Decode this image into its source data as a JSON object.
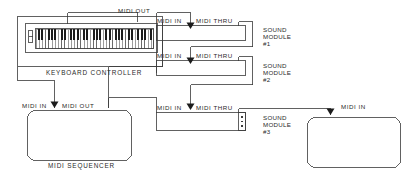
{
  "diagram": {
    "colors": {
      "line": "#3a3a3a",
      "text": "#2a2a2a",
      "key_white": "#ffffff",
      "key_black": "#1c1c1c",
      "background": "#ffffff"
    },
    "devices": [
      {
        "id": "keyboard-controller",
        "name": "KEYBOARD CONTROLLER",
        "ports": [
          {
            "label": "MIDI OUT",
            "type": "out"
          }
        ]
      },
      {
        "id": "sound-module-1",
        "name": "SOUND MODULE #1",
        "name_lines": [
          "SOUND",
          "MODULE",
          "#1"
        ],
        "ports": [
          {
            "label": "MIDI IN",
            "type": "in"
          },
          {
            "label": "MIDI THRU",
            "type": "thru"
          }
        ]
      },
      {
        "id": "sound-module-2",
        "name": "SOUND MODULE #2",
        "name_lines": [
          "SOUND",
          "MODULE",
          "#2"
        ],
        "ports": [
          {
            "label": "MIDI IN",
            "type": "in"
          },
          {
            "label": "MIDI THRU",
            "type": "thru"
          }
        ]
      },
      {
        "id": "sound-module-3",
        "name": "SOUND MODULE #3",
        "name_lines": [
          "SOUND",
          "MODULE",
          "#3"
        ],
        "ports": [
          {
            "label": "MIDI IN",
            "type": "in"
          },
          {
            "label": "MIDI THRU",
            "type": "thru"
          }
        ]
      },
      {
        "id": "midi-sequencer",
        "name": "MIDI SEQUENCER",
        "ports": [
          {
            "label": "MIDI IN",
            "type": "in"
          },
          {
            "label": "MIDI OUT",
            "type": "out"
          }
        ]
      },
      {
        "id": "final-device",
        "name": "",
        "ports": [
          {
            "label": "MIDI IN",
            "type": "in"
          }
        ]
      }
    ],
    "labels": {
      "keyboard_midi_out": "MIDI OUT",
      "keyboard_name": "KEYBOARD CONTROLLER",
      "m1_midi_in": "MIDI IN",
      "m1_midi_thru": "MIDI THRU",
      "m1_l1": "SOUND",
      "m1_l2": "MODULE",
      "m1_l3": "#1",
      "m2_midi_in": "MIDI IN",
      "m2_midi_thru": "MIDI THRU",
      "m2_l1": "SOUND",
      "m2_l2": "MODULE",
      "m2_l3": "#2",
      "m3_midi_in": "MIDI IN",
      "m3_midi_thru": "MIDI THRU",
      "m3_l1": "SOUND",
      "m3_l2": "MODULE",
      "m3_l3": "#3",
      "seq_midi_in": "MIDI IN",
      "seq_midi_out": "MIDI OUT",
      "seq_name": "MIDI SEQUENCER",
      "final_midi_in": "MIDI IN"
    },
    "connections": [
      {
        "from": "keyboard-controller.MIDI OUT",
        "to": "sound-module-1.MIDI IN"
      },
      {
        "from": "keyboard-controller.MIDI OUT",
        "to": "midi-sequencer.MIDI IN"
      },
      {
        "from": "sound-module-1.MIDI THRU",
        "to": "sound-module-2.MIDI IN"
      },
      {
        "from": "midi-sequencer.MIDI OUT",
        "to": "sound-module-3.MIDI IN"
      },
      {
        "from": "sound-module-2.MIDI THRU",
        "to": "sound-module-3.MIDI IN"
      },
      {
        "from": "sound-module-3.MIDI THRU",
        "to": "final-device.MIDI IN"
      }
    ]
  }
}
